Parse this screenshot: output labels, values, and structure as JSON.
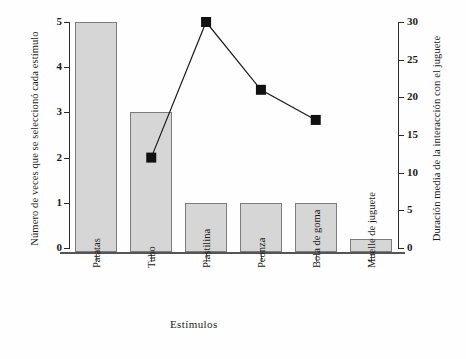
{
  "chart_data": {
    "type": "bar",
    "title": "",
    "categories": [
      "Patatas",
      "Tubo",
      "Plastilina",
      "Peonza",
      "Bola de goma",
      "Muelle de juguete"
    ],
    "xlabel": "Estímulos",
    "series": [
      {
        "name": "Número de veces que se seleccionó cada estímulo",
        "type": "bar",
        "axis": "left",
        "values": [
          5,
          3,
          1,
          1,
          1,
          0.2
        ]
      },
      {
        "name": "Duración media de la interacción con el juguete",
        "type": "line",
        "axis": "right",
        "marker": "filled-square",
        "x": [
          "Tubo",
          "Plastilina",
          "Peonza",
          "Bola de goma"
        ],
        "values": [
          12,
          30,
          21,
          17
        ]
      }
    ],
    "left_axis": {
      "label": "Número de veces que se seleccionó cada estímulo",
      "ticks": [
        "0",
        "1",
        "2",
        "3",
        "4",
        "5"
      ],
      "ylim": [
        0,
        5
      ]
    },
    "right_axis": {
      "label": "Duración media de la interacción con el juguete",
      "ticks": [
        "0",
        "5",
        "10",
        "15",
        "20",
        "25",
        "30"
      ],
      "ylim": [
        0,
        30
      ]
    },
    "grid": false,
    "legend": "none",
    "colors": {
      "bar_fill": "#d6d6d6",
      "bar_edge": "#7c7c7c",
      "line": "#1a1a1a",
      "marker": "#111111",
      "axis": "#2b2b2b"
    }
  }
}
